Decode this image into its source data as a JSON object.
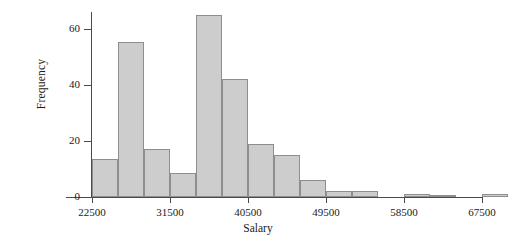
{
  "chart_data": {
    "type": "bar",
    "title": "",
    "xlabel": "Salary",
    "ylabel": "Frequency",
    "bin_width": 3000,
    "bin_start": 22500,
    "xlim": [
      21000,
      70500
    ],
    "ylim": [
      0,
      66
    ],
    "grid": false,
    "legend": null,
    "xticks": [
      22500,
      31500,
      40500,
      49500,
      58500,
      67500
    ],
    "xtick_labels": [
      "22500",
      "31500",
      "40500",
      "49500",
      "58500",
      "67500"
    ],
    "yticks": [
      0,
      20,
      40,
      60
    ],
    "ytick_labels": [
      "0",
      "20",
      "40",
      "60"
    ],
    "bin_edges": [
      22500,
      25500,
      28500,
      31500,
      34500,
      37500,
      40500,
      43500,
      46500,
      49500,
      52500,
      55500,
      58500,
      61500,
      64500,
      67500,
      70500
    ],
    "categories": [
      "22500-25500",
      "25500-28500",
      "28500-31500",
      "31500-34500",
      "34500-37500",
      "37500-40500",
      "40500-43500",
      "43500-46500",
      "46500-49500",
      "49500-52500",
      "52500-55500",
      "55500-58500",
      "58500-61500",
      "61500-64500",
      "64500-67500",
      "67500-70500"
    ],
    "values": [
      13.5,
      55.5,
      17,
      8.5,
      65,
      42,
      19,
      15,
      6,
      2,
      2,
      0,
      1,
      0.5,
      0,
      1
    ]
  },
  "axis_colors": {
    "bar_fill": "#cdcdcd",
    "bar_stroke": "#8e8e8e",
    "axis_line": "#4a4a4a",
    "text": "#1a1a1a",
    "background": "#ffffff"
  }
}
